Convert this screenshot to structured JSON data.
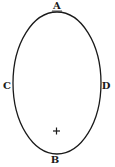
{
  "diagram": {
    "type": "ellipse",
    "shape": {
      "cx": 57,
      "cy": 83,
      "rx": 44,
      "ry": 71,
      "stroke": "#1a1a1a",
      "fill": "#ffffff"
    },
    "labels": [
      {
        "id": "A",
        "text": "A",
        "position": "top"
      },
      {
        "id": "B",
        "text": "B",
        "position": "bottom"
      },
      {
        "id": "C",
        "text": "C",
        "position": "left"
      },
      {
        "id": "D",
        "text": "D",
        "position": "right"
      }
    ],
    "marker": {
      "symbol": "+",
      "position": "lower focus"
    }
  }
}
